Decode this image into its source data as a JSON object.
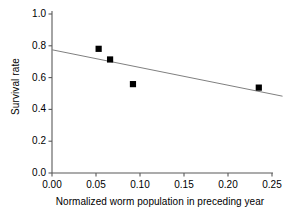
{
  "chart_data": {
    "type": "scatter",
    "title": "",
    "xlabel": "Normalized worm population in preceding year",
    "ylabel": "Survival rate",
    "xlim": [
      0.0,
      0.25
    ],
    "ylim": [
      0.0,
      1.0
    ],
    "xticks": [
      "0.00",
      "0.05",
      "0.10",
      "0.15",
      "0.20",
      "0.25"
    ],
    "xtick_values": [
      0.0,
      0.05,
      0.1,
      0.15,
      0.2,
      0.25
    ],
    "yticks": [
      "0.0",
      "0.2",
      "0.4",
      "0.6",
      "0.8",
      "1.0"
    ],
    "ytick_values": [
      0.0,
      0.2,
      0.4,
      0.6,
      0.8,
      1.0
    ],
    "grid": false,
    "legend": "none",
    "marker": "filled-square",
    "marker_color": "#000000",
    "points": [
      {
        "x": 0.053,
        "y": 0.781
      },
      {
        "x": 0.066,
        "y": 0.714
      },
      {
        "x": 0.092,
        "y": 0.559
      },
      {
        "x": 0.235,
        "y": 0.537
      }
    ],
    "series": [
      {
        "name": "Survival rate observations",
        "x": [
          0.053,
          0.066,
          0.092,
          0.235
        ],
        "values": [
          0.781,
          0.714,
          0.559,
          0.537
        ]
      }
    ],
    "trendline": {
      "type": "linear",
      "color": "#808080",
      "x_start": 0.0,
      "y_start": 0.775,
      "x_end": 0.262,
      "y_end": 0.483
    },
    "axis_color": "#595959",
    "background": "#ffffff"
  }
}
